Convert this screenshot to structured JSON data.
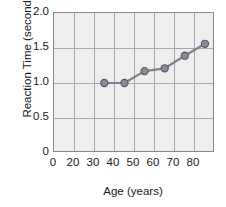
{
  "chart_data": {
    "type": "line",
    "title": "",
    "xlabel": "Age (years)",
    "ylabel": "Reaction Time (seconds)",
    "x": [
      25,
      35,
      45,
      55,
      65,
      75
    ],
    "values": [
      1.0,
      1.0,
      1.17,
      1.21,
      1.39,
      1.56
    ],
    "series": [
      {
        "name": "Reaction Time",
        "values": [
          1.0,
          1.0,
          1.17,
          1.21,
          1.39,
          1.56
        ]
      }
    ],
    "xlim": [
      0,
      80
    ],
    "ylim": [
      0,
      2.0
    ],
    "xticks": [
      "0",
      "20",
      "30",
      "40",
      "50",
      "60",
      "70",
      "80"
    ],
    "xtick_values": [
      0,
      20,
      30,
      40,
      50,
      60,
      70,
      80
    ],
    "yticks": [
      "0",
      "0.5",
      "1.0",
      "1.5",
      "2.0"
    ],
    "ytick_values": [
      0,
      0.5,
      1.0,
      1.5,
      2.0
    ],
    "grid": true,
    "legend": "none",
    "marker": "circle",
    "colors": {
      "marker_fill": "#8a8d99",
      "marker_edge": "#55575e",
      "line": "#7f8289",
      "plot_background": "#eeeeee",
      "gridline": "#a8a8a8",
      "frame": "#8a8a8a",
      "text": "#1a1a1a"
    }
  }
}
